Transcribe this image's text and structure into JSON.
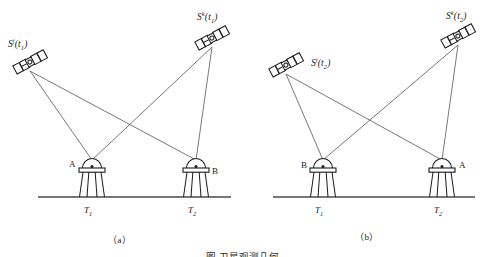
{
  "figure": {
    "caption_cut": "图  卫星观测几何",
    "panels": [
      {
        "id": "a",
        "caption": "（a）",
        "satellites": [
          {
            "name": "sat-j-t1",
            "label_s": "S",
            "label_sup": "j",
            "label_open": "(",
            "label_sub": "t",
            "label_subnum": "1",
            "label_close": ")",
            "x": 30,
            "y": 62,
            "angle": -28,
            "label_x": 8,
            "label_y": 38
          },
          {
            "name": "sat-k-t1",
            "label_s": "S",
            "label_sup": "k",
            "label_open": "(",
            "label_sub": "t",
            "label_subnum": "1",
            "label_close": ")",
            "x": 212,
            "y": 38,
            "angle": -28,
            "label_x": 197,
            "label_y": 11
          }
        ],
        "stations": [
          {
            "name": "station-a",
            "label": "A",
            "x": 92,
            "y": 168,
            "label_x": 69,
            "label_y": 160
          },
          {
            "name": "station-b",
            "label": "B",
            "x": 196,
            "y": 168,
            "label_x": 212,
            "label_y": 167
          }
        ],
        "towers": [
          {
            "name": "tower-t1",
            "label_t": "T",
            "label_sub": "1",
            "x": 92,
            "label_x": 84,
            "label_y": 206
          },
          {
            "name": "tower-t2",
            "label_t": "T",
            "label_sub": "2",
            "x": 196,
            "label_x": 188,
            "label_y": 206
          }
        ],
        "ground": {
          "x1": 38,
          "x2": 231,
          "y": 197
        },
        "caption_x": 108,
        "caption_y": 236
      },
      {
        "id": "b",
        "caption": "（b）",
        "satellites": [
          {
            "name": "sat-j-t2",
            "label_s": "S",
            "label_sup": "j",
            "label_open": "(",
            "label_sub": "t",
            "label_subnum": "2",
            "label_close": ")",
            "x": 43,
            "y": 65,
            "angle": -28,
            "label_x": 68,
            "label_y": 57
          },
          {
            "name": "sat-k-t2",
            "label_s": "S",
            "label_sup": "k",
            "label_open": "(",
            "label_sub": "t",
            "label_subnum": "2",
            "label_close": ")",
            "x": 215,
            "y": 36,
            "angle": -28,
            "label_x": 203,
            "label_y": 10
          }
        ],
        "stations": [
          {
            "name": "station-b",
            "label": "B",
            "x": 80,
            "y": 168,
            "label_x": 58,
            "label_y": 161
          },
          {
            "name": "station-a",
            "label": "A",
            "x": 199,
            "y": 168,
            "label_x": 216,
            "label_y": 161
          }
        ],
        "towers": [
          {
            "name": "tower-t1",
            "label_t": "T",
            "label_sub": "1",
            "x": 80,
            "label_x": 72,
            "label_y": 206
          },
          {
            "name": "tower-t2",
            "label_t": "T",
            "label_sub": "2",
            "x": 199,
            "label_x": 191,
            "label_y": 206
          }
        ],
        "ground": {
          "x1": 30,
          "x2": 232,
          "y": 197
        },
        "caption_x": 112,
        "caption_y": 233
      }
    ]
  },
  "style": {
    "line_color": "#555555",
    "ink_color": "#1a1a1a",
    "ground_color": "#4a4a4a"
  }
}
